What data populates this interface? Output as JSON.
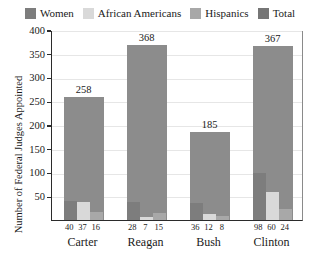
{
  "chart_data": {
    "type": "bar",
    "title": "",
    "xlabel": "",
    "ylabel": "Number of Federal Judges Appointed",
    "categories": [
      "Carter",
      "Reagan",
      "Bush",
      "Clinton"
    ],
    "ylim": [
      0,
      400
    ],
    "yticks": [
      50,
      100,
      150,
      200,
      250,
      300,
      350,
      400
    ],
    "grid": true,
    "legend_position": "top",
    "series": [
      {
        "name": "Women",
        "values": [
          40,
          37,
          36,
          98
        ],
        "color": "#7d7d7d"
      },
      {
        "name": "African Americans",
        "values": [
          37,
          7,
          12,
          60
        ],
        "color": "#d9d9d9"
      },
      {
        "name": "Hispanics",
        "values": [
          16,
          15,
          8,
          24
        ],
        "color": "#a8a8a8"
      },
      {
        "name": "Total",
        "values": [
          258,
          368,
          185,
          367
        ],
        "color": "#8c8c8c"
      }
    ],
    "total_labels": [
      "258",
      "368",
      "185",
      "367"
    ],
    "sub_value_labels": [
      [
        "40",
        "37",
        "16"
      ],
      [
        "28",
        "7",
        "15"
      ],
      [
        "36",
        "12",
        "8"
      ],
      [
        "98",
        "60",
        "24"
      ]
    ]
  },
  "legend": {
    "items": [
      {
        "label": "Women",
        "color": "#7d7d7d"
      },
      {
        "label": "African Americans",
        "color": "#d9d9d9"
      },
      {
        "label": "Hispanics",
        "color": "#a8a8a8"
      },
      {
        "label": "Total",
        "color": "#767676"
      }
    ]
  },
  "axes": {
    "y_title": "Number of Federal Judges Appointed",
    "y_tick_labels": [
      "400",
      "350",
      "300",
      "250",
      "200",
      "150",
      "100",
      "50"
    ]
  }
}
